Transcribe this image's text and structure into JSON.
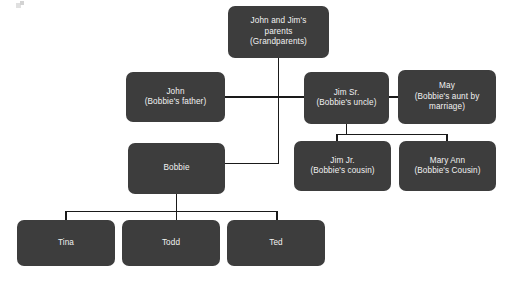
{
  "diagram": {
    "box_color": "#3d3d3d",
    "text_color": "#f2f2f2",
    "connector_color": "#1a1a1a",
    "background": "#ffffff",
    "nodes": [
      {
        "id": "grandparents",
        "name": "grandparents",
        "lines": [
          "John and Jim's",
          "parents",
          "(Grandparents)"
        ]
      },
      {
        "id": "john",
        "name": "john",
        "lines": [
          "John",
          "(Bobbie's father)"
        ]
      },
      {
        "id": "jim-sr",
        "name": "jim-sr",
        "lines": [
          "Jim Sr.",
          "(Bobbie's uncle)"
        ]
      },
      {
        "id": "may",
        "name": "may",
        "lines": [
          "May",
          "(Bobbie's aunt by",
          "marriage)"
        ]
      },
      {
        "id": "bobbie",
        "name": "bobbie",
        "lines": [
          "Bobbie"
        ]
      },
      {
        "id": "jim-jr",
        "name": "jim-jr",
        "lines": [
          "Jim Jr.",
          "(Bobbie's cousin)"
        ]
      },
      {
        "id": "mary-ann",
        "name": "mary-ann",
        "lines": [
          "Mary Ann",
          "(Bobbie's Cousin)"
        ]
      },
      {
        "id": "tina",
        "name": "tina",
        "lines": [
          "Tina"
        ]
      },
      {
        "id": "todd",
        "name": "todd",
        "lines": [
          "Todd"
        ]
      },
      {
        "id": "ted",
        "name": "ted",
        "lines": [
          "Ted"
        ]
      }
    ]
  }
}
